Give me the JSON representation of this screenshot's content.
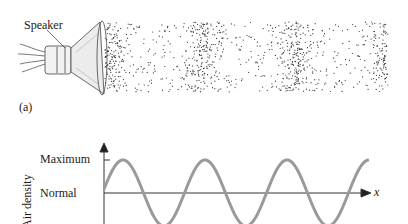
{
  "figure_a": {
    "panel_label": "(a)",
    "speaker_label": "Speaker",
    "compression_band_x": [
      110,
      202,
      295,
      386
    ],
    "dot_region": {
      "x0": 105,
      "x1": 388,
      "y0": 22,
      "y1": 92
    }
  },
  "chart_data": {
    "type": "line",
    "title": "",
    "xlabel": "x",
    "ylabel": "Air density",
    "y_tick_labels": [
      "Maximum",
      "Normal"
    ],
    "function": "sinusoid",
    "wavelength_px": 82,
    "series": [
      {
        "name": "Air density",
        "color": "#9a9a9a"
      }
    ],
    "grid": false
  },
  "graph": {
    "y_axis_label": "Air density",
    "tick_maximum": "Maximum",
    "tick_normal": "Normal",
    "x_axis_label": "x"
  }
}
